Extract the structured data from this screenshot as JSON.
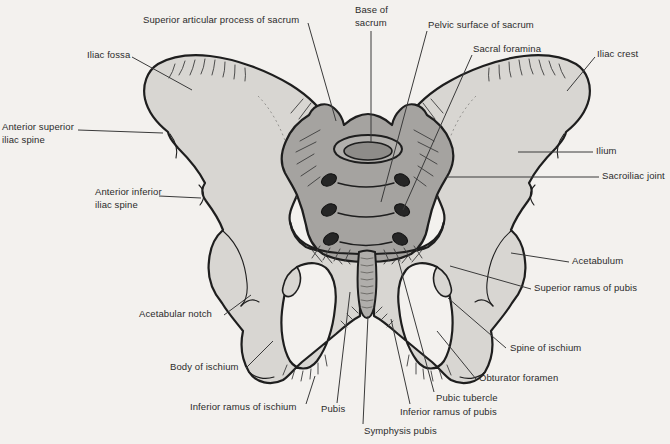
{
  "figure": {
    "background_color": "#f3f1ee",
    "bone_color": "#d8d6d2",
    "sacrum_color": "#a5a3a0",
    "outline_color": "#1e1e1e",
    "label_color": "#2b2b2b",
    "leader_color": "#3a3a3a",
    "labels": [
      {
        "id": "superior-articular-process-of-sacrum",
        "text": "Superior articular process of sacrum",
        "x": 143,
        "y": 14,
        "leader": [
          308,
          23,
          336,
          121
        ]
      },
      {
        "id": "base-of-sacrum",
        "text": "Base of\nsacrum",
        "x": 355,
        "y": 4,
        "leader": [
          371,
          31,
          371,
          142
        ]
      },
      {
        "id": "pelvic-surface-of-sacrum",
        "text": "Pelvic surface of sacrum",
        "x": 428,
        "y": 19,
        "leader": [
          427,
          31,
          381,
          202
        ]
      },
      {
        "id": "sacral-foramina",
        "text": "Sacral foramina",
        "x": 473,
        "y": 43,
        "leader": [
          472,
          55,
          403,
          210
        ]
      },
      {
        "id": "iliac-crest",
        "text": "Iliac crest",
        "x": 597,
        "y": 48,
        "leader": [
          595,
          57,
          567,
          91
        ]
      },
      {
        "id": "iliac-fossa",
        "text": "Iliac fossa",
        "x": 87,
        "y": 49,
        "leader": [
          132,
          57,
          192,
          90
        ]
      },
      {
        "id": "anterior-superior-iliac-spine",
        "text": "Anterior superior\niliac spine",
        "x": 2,
        "y": 121,
        "leader": [
          78,
          130,
          163,
          133
        ]
      },
      {
        "id": "anterior-inferior-iliac-spine",
        "text": "Anterior inferior\niliac spine",
        "x": 95,
        "y": 186,
        "leader": [
          159,
          196,
          201,
          198
        ]
      },
      {
        "id": "ilium",
        "text": "Ilium",
        "x": 596,
        "y": 145,
        "leader": [
          593,
          152,
          518,
          152
        ]
      },
      {
        "id": "sacroiliac-joint",
        "text": "Sacroiliac joint",
        "x": 602,
        "y": 170,
        "leader": [
          599,
          177,
          446,
          177
        ]
      },
      {
        "id": "acetabulum",
        "text": "Acetabulum",
        "x": 572,
        "y": 255,
        "leader": [
          569,
          262,
          511,
          253
        ]
      },
      {
        "id": "superior-ramus-of-pubis",
        "text": "Superior ramus of pubis",
        "x": 534,
        "y": 282,
        "leader": [
          531,
          289,
          450,
          266
        ]
      },
      {
        "id": "spine-of-ischium",
        "text": "Spine of ischium",
        "x": 510,
        "y": 342,
        "leader": [
          506,
          348,
          448,
          298
        ]
      },
      {
        "id": "obturator-foramen",
        "text": "Obturator foramen",
        "x": 479,
        "y": 372,
        "leader": [
          476,
          379,
          437,
          331
        ]
      },
      {
        "id": "pubic-tubercle",
        "text": "Pubic tubercle",
        "x": 436,
        "y": 392,
        "leader": [
          434,
          392,
          398,
          259
        ]
      },
      {
        "id": "inferior-ramus-of-pubis",
        "text": "Inferior ramus of pubis",
        "x": 400,
        "y": 406,
        "leader": [
          410,
          404,
          391,
          319
        ]
      },
      {
        "id": "symphysis-pubis",
        "text": "Symphysis pubis",
        "x": 364,
        "y": 425,
        "leader": [
          363,
          424,
          368,
          316
        ]
      },
      {
        "id": "pubis",
        "text": "Pubis",
        "x": 321,
        "y": 403,
        "leader": [
          337,
          403,
          350,
          292
        ]
      },
      {
        "id": "acetabular-notch",
        "text": "Acetabular notch",
        "x": 139,
        "y": 308,
        "leader": [
          224,
          315,
          251,
          295
        ]
      },
      {
        "id": "body-of-ischium",
        "text": "Body of ischium",
        "x": 170,
        "y": 361,
        "leader": [
          246,
          368,
          273,
          341
        ]
      },
      {
        "id": "inferior-ramus-of-ischium",
        "text": "Inferior ramus of ischium",
        "x": 190,
        "y": 401,
        "leader": [
          306,
          404,
          315,
          376
        ]
      }
    ]
  }
}
